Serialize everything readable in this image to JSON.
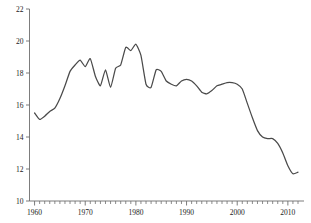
{
  "chart_data": {
    "type": "line",
    "title": "",
    "subtitle": "",
    "xlabel": "",
    "ylabel": "",
    "xlim": [
      1959,
      2012
    ],
    "ylim": [
      10,
      22
    ],
    "grid": false,
    "legend": false,
    "legend_position": "none",
    "line_color": "#4a4a4a",
    "axis_color": "#6e6e6e",
    "y_ticks": [
      10,
      12,
      14,
      16,
      18,
      20,
      22
    ],
    "y_tick_labels": [
      "10",
      "12",
      "14",
      "16",
      "18",
      "20",
      "22"
    ],
    "x_ticks": [
      1960,
      1970,
      1980,
      1990,
      2000,
      2010
    ],
    "x_tick_labels": [
      "1960",
      "1970",
      "1980",
      "1990",
      "2000",
      "2010"
    ],
    "x_minor_tick_step": 1,
    "x": [
      1960,
      1961,
      1962,
      1963,
      1964,
      1965,
      1966,
      1967,
      1968,
      1969,
      1970,
      1971,
      1972,
      1973,
      1974,
      1975,
      1976,
      1977,
      1978,
      1979,
      1980,
      1981,
      1982,
      1983,
      1984,
      1985,
      1986,
      1987,
      1988,
      1989,
      1990,
      1991,
      1992,
      1993,
      1994,
      1995,
      1996,
      1997,
      1998,
      1999,
      2000,
      2001,
      2002,
      2003,
      2004,
      2005,
      2006,
      2007,
      2008,
      2009,
      2010,
      2011,
      2012
    ],
    "values": [
      15.5,
      15.1,
      15.3,
      15.6,
      15.8,
      16.4,
      17.2,
      18.1,
      18.5,
      18.8,
      18.4,
      18.9,
      17.8,
      17.2,
      18.2,
      17.1,
      18.3,
      18.5,
      19.6,
      19.4,
      19.8,
      19.1,
      17.3,
      17.1,
      18.2,
      18.1,
      17.5,
      17.3,
      17.2,
      17.5,
      17.6,
      17.5,
      17.2,
      16.8,
      16.7,
      16.9,
      17.2,
      17.3,
      17.4,
      17.4,
      17.3,
      17.0,
      16.1,
      15.2,
      14.4,
      14.0,
      13.9,
      13.9,
      13.6,
      13.0,
      12.2,
      11.7,
      11.8
    ],
    "series": [
      {
        "name": "series-1",
        "color": "#4a4a4a",
        "values": [
          15.5,
          15.1,
          15.3,
          15.6,
          15.8,
          16.4,
          17.2,
          18.1,
          18.5,
          18.8,
          18.4,
          18.9,
          17.8,
          17.2,
          18.2,
          17.1,
          18.3,
          18.5,
          19.6,
          19.4,
          19.8,
          19.1,
          17.3,
          17.1,
          18.2,
          18.1,
          17.5,
          17.3,
          17.2,
          17.5,
          17.6,
          17.5,
          17.2,
          16.8,
          16.7,
          16.9,
          17.2,
          17.3,
          17.4,
          17.4,
          17.3,
          17.0,
          16.1,
          15.2,
          14.4,
          14.0,
          13.9,
          13.9,
          13.6,
          13.0,
          12.2,
          11.7,
          11.8
        ]
      }
    ]
  }
}
